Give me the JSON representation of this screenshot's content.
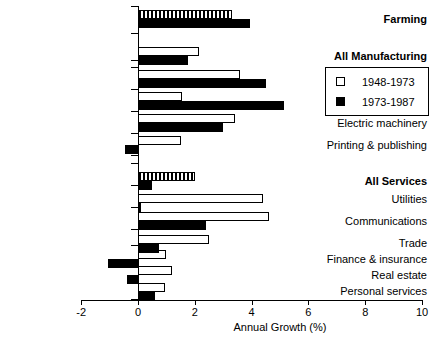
{
  "chart_data": {
    "type": "bar",
    "orientation": "horizontal",
    "title": "",
    "xlabel": "Annual Growth (%)",
    "ylabel": "",
    "xlim": [
      -2,
      10
    ],
    "xticks": [
      -2,
      0,
      2,
      4,
      6,
      8,
      10
    ],
    "xtick_labels": [
      "-2",
      "0",
      "2",
      "4",
      "6",
      "8",
      "10"
    ],
    "grid": false,
    "legend_position": "upper right",
    "categories": [
      "Farming",
      "All Manufacturing",
      "Textiles",
      "“Computers”",
      "Electric machinery",
      "Printing & publishing",
      "All Services",
      "Utilities",
      "Communications",
      "Trade",
      "Finance & insurance",
      "Real estate",
      "Personal services"
    ],
    "category_bold": [
      true,
      true,
      false,
      false,
      false,
      false,
      true,
      false,
      false,
      false,
      false,
      false,
      false
    ],
    "series": [
      {
        "name": "1948-1973",
        "style": "white",
        "values": [
          3.3,
          2.15,
          3.6,
          1.55,
          3.4,
          1.5,
          2.0,
          4.4,
          4.6,
          2.5,
          1.0,
          1.2,
          0.95
        ]
      },
      {
        "name": "1973-1987",
        "style": "black",
        "values": [
          3.95,
          1.75,
          4.5,
          5.15,
          3.0,
          -0.45,
          0.5,
          0.1,
          2.4,
          0.75,
          -1.05,
          -0.4,
          0.6
        ]
      }
    ],
    "highlight_hatch_rows": [
      0,
      6
    ],
    "colors": {
      "period_1948_1973": "#ffffff",
      "period_1973_1987": "#000000",
      "axis": "#000000",
      "background": "#ffffff"
    }
  },
  "legend": {
    "entries": [
      {
        "label": "1948-1973",
        "swatch": "white"
      },
      {
        "label": "1973-1987",
        "swatch": "black"
      }
    ]
  }
}
